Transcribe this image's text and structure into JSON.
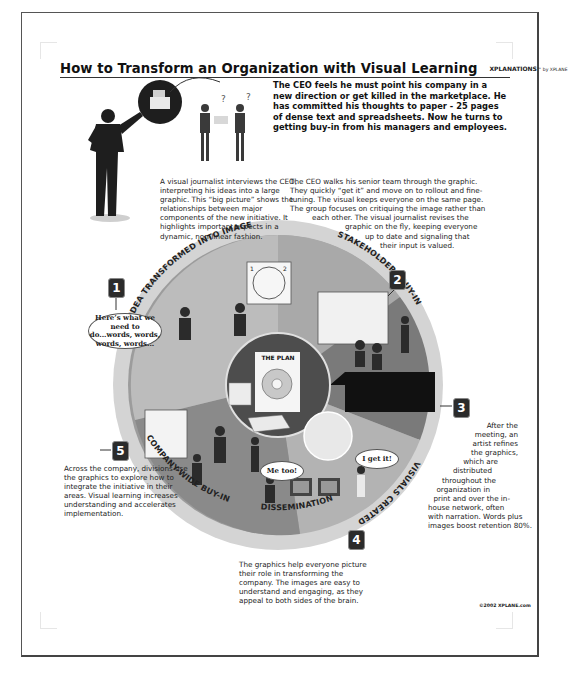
{
  "document": {
    "title": "How to Transform an Organization with Visual Learning",
    "brand": "XPLANATIONS",
    "brand_suffix": "by XPLANE",
    "copyright": "©2002 XPLANE.com"
  },
  "intro_text": "The CEO feels he must point his company in a new direction or get killed in the marketplace. He has committed his thoughts to paper - 25 pages of dense text and spreadsheets. Now he turns to getting buy-in from his managers and employees.",
  "steps": [
    {
      "number": "1",
      "label": "IDEA TRANSFORMED INTO IMAGE",
      "text": "A visual journalist interviews the CEO, interpreting his ideas into a large graphic. This “big picture” shows the relationships between major components of the new initiative. It highlights important aspects in a dynamic, non-linear fashion."
    },
    {
      "number": "2",
      "label": "STAKEHOLDERS BUY-IN",
      "text_lines": [
        "The CEO walks his senior team through the graphic.",
        "They quickly “get it” and move on to rollout and fine-",
        "tuning. The visual keeps everyone on the same page.",
        "The group focuses on critiquing the image rather than",
        "each other. The visual journalist revises the",
        "graphic on the fly, keeping everyone",
        "up to date and signaling that",
        "their input is valued."
      ]
    },
    {
      "number": "3",
      "label": "VISUALS CREATED",
      "text_lines": [
        "After the",
        "meeting, an",
        "artist refines",
        "the graphics,",
        "which are",
        "distributed",
        "throughout the",
        "organization in",
        "print and over the in-",
        "house network, often",
        "with narration. Words plus",
        "images boost retention 80%."
      ]
    },
    {
      "number": "4",
      "label": "DISSEMINATION",
      "text": "The graphics help everyone picture their role in transforming the company. The images are easy to understand and engaging, as they appeal to both sides of the brain."
    },
    {
      "number": "5",
      "label": "COMPANY-WIDE BUY-IN",
      "text": "Across the company, divisions use the graphics to explore how to integrate the initiative in their areas. Visual learning increases understanding and accelerates implementation."
    }
  ],
  "center": {
    "plan_title": "THE PLAN",
    "plan_numbers": [
      "1",
      "2",
      "3",
      "4",
      "5"
    ]
  },
  "speech_bubbles": {
    "ceo": "Here’s what we need to do...words, words, words, words...",
    "me_too": "Me too!",
    "got_it": "I get it!"
  },
  "colors": {
    "ring_outer": "#b9b9b9",
    "ring_inner": "#8e8e8e",
    "center": "#5a5a5a",
    "badge": "#2b2b2b",
    "text": "#1a1a1a"
  }
}
